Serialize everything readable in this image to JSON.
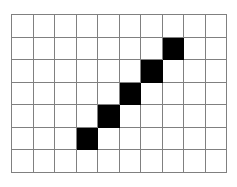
{
  "figure": {
    "name": "grid-staircase-pattern",
    "columns": 10,
    "rows": 7,
    "grid_line_color": "#808080",
    "cell_empty_color": "#ffffff",
    "cell_filled_color": "#000000",
    "background_color": "#ffffff",
    "filled_cells": [
      {
        "row": 1,
        "col": 7
      },
      {
        "row": 2,
        "col": 6
      },
      {
        "row": 3,
        "col": 5
      },
      {
        "row": 4,
        "col": 4
      },
      {
        "row": 5,
        "col": 3
      }
    ],
    "cells": [
      [
        0,
        0,
        0,
        0,
        0,
        0,
        0,
        0,
        0,
        0
      ],
      [
        0,
        0,
        0,
        0,
        0,
        0,
        0,
        1,
        0,
        0
      ],
      [
        0,
        0,
        0,
        0,
        0,
        0,
        1,
        0,
        0,
        0
      ],
      [
        0,
        0,
        0,
        0,
        0,
        1,
        0,
        0,
        0,
        0
      ],
      [
        0,
        0,
        0,
        0,
        1,
        0,
        0,
        0,
        0,
        0
      ],
      [
        0,
        0,
        0,
        1,
        0,
        0,
        0,
        0,
        0,
        0
      ],
      [
        0,
        0,
        0,
        0,
        0,
        0,
        0,
        0,
        0,
        0
      ]
    ]
  }
}
